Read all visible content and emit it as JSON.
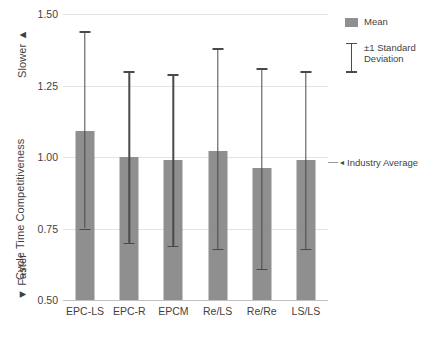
{
  "chart_data": {
    "type": "bar",
    "title": "",
    "xlabel": "",
    "ylabel": "Cycle Time Competitiveness",
    "ylim": [
      0.5,
      1.5
    ],
    "ytick_labels": [
      "1.50",
      "1.25",
      "1.00",
      "0.75",
      "0.50"
    ],
    "ytick_values": [
      1.5,
      1.25,
      1.0,
      0.75,
      0.5
    ],
    "grid": true,
    "categories": [
      "EPC-LS",
      "EPC-R",
      "EPCM",
      "Re/LS",
      "Re/Re",
      "LS/LS"
    ],
    "series": [
      {
        "name": "Mean",
        "values": [
          1.09,
          1.0,
          0.99,
          1.02,
          0.96,
          0.99
        ],
        "error_upper": [
          1.44,
          1.3,
          1.29,
          1.38,
          1.31,
          1.3
        ],
        "error_lower": [
          0.75,
          0.7,
          0.69,
          0.68,
          0.61,
          0.68
        ],
        "color": "#8f8f8f"
      }
    ],
    "annotations": [
      {
        "name": "industry-average",
        "text": "Industry Average",
        "y": 1.0,
        "arrow": "◂"
      },
      {
        "name": "slower-direction",
        "text": "Slower",
        "arrow": "▲"
      },
      {
        "name": "faster-direction",
        "text": "Faster",
        "arrow": "▼"
      }
    ],
    "legend": {
      "position": "right-top",
      "entries": [
        {
          "label": "Mean",
          "marker": "square",
          "color": "#8f8f8f"
        },
        {
          "label": "±1 Standard Deviation",
          "marker": "errorbar",
          "color": "#4a4a4a"
        }
      ]
    }
  },
  "axis": {
    "y_title": "Cycle Time Competitiveness",
    "slower_label": "Slower",
    "slower_arrow": "▲",
    "faster_label": "Faster",
    "faster_arrow": "▼"
  },
  "legend": {
    "mean_label": "Mean",
    "std_label": "±1 Standard\nDeviation",
    "std_label_line1": "±1 Standard",
    "std_label_line2": "Deviation"
  },
  "annotation": {
    "industry_average_arrow": "◂",
    "industry_average_label": "Industry Average"
  }
}
